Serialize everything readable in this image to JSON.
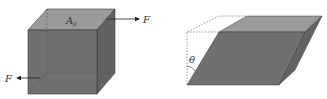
{
  "diagram": {
    "left_figure": {
      "description": "cube with shear forces",
      "area_label": "A",
      "area_subscript": "0",
      "force_top_label": "F",
      "force_bottom_label": "F"
    },
    "right_figure": {
      "description": "sheared block (parallelepiped)",
      "angle_label": "θ"
    },
    "colors": {
      "front_face": "#707070",
      "top_face": "#9a9a9a",
      "side_face": "#626262",
      "edge": "#3a3a3a",
      "dashed": "#555555",
      "arrow": "#222222"
    }
  }
}
